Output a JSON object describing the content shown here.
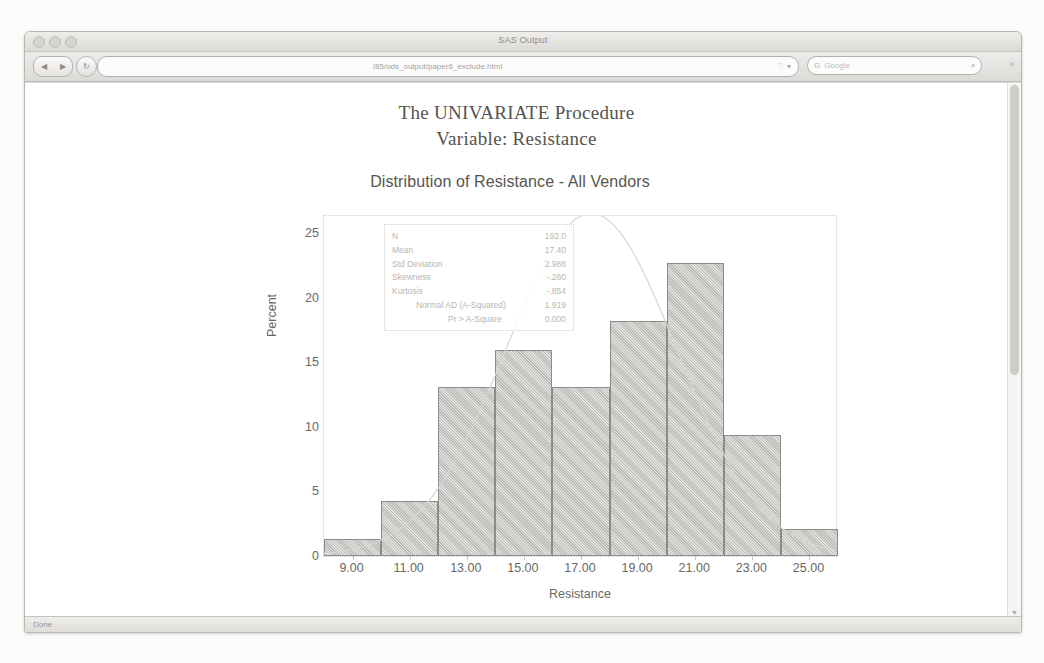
{
  "window": {
    "title": "SAS Output",
    "traffic_lights": [
      "close",
      "minimize",
      "zoom"
    ],
    "status_text": "Done"
  },
  "toolbar": {
    "back_label": "◀",
    "forward_label": "▶",
    "reload_label": "↻",
    "stop_label": "✕",
    "home_label": "⌂",
    "url": "/85/ods_output/paper6_exclude.html",
    "url_bookmark_icon": "♡",
    "url_dropdown_icon": "▾",
    "search_engine_icon": "G",
    "search_placeholder": "Google",
    "search_magnifier_icon": "⌕",
    "overflow_icon": "»"
  },
  "report": {
    "proc_title": "The UNIVARIATE Procedure",
    "proc_subtitle": "Variable: Resistance"
  },
  "chart_data": {
    "type": "bar",
    "title": "Distribution of Resistance - All Vendors",
    "xlabel": "Resistance",
    "ylabel": "Percent",
    "xlim": [
      8.0,
      26.0
    ],
    "ylim": [
      0,
      26.5
    ],
    "grid": false,
    "bin_width": 2.0,
    "bin_starts": [
      8.0,
      10.0,
      12.0,
      14.0,
      16.0,
      18.0,
      20.0,
      22.0,
      24.0
    ],
    "bin_centers": [
      9.0,
      11.0,
      13.0,
      15.0,
      17.0,
      19.0,
      21.0,
      23.0,
      25.0
    ],
    "values": [
      1.3,
      4.3,
      13.1,
      16.0,
      13.1,
      18.2,
      22.7,
      9.4,
      2.1
    ],
    "xticks": [
      "9.00",
      "11.00",
      "13.00",
      "15.00",
      "17.00",
      "19.00",
      "21.00",
      "23.00",
      "25.00"
    ],
    "yticks": [
      "0",
      "5",
      "10",
      "15",
      "20",
      "25"
    ],
    "ytick_values": [
      0,
      5,
      10,
      15,
      20,
      25
    ],
    "overlay": {
      "name": "Normal curve",
      "mean": 17.4,
      "std": 2.988
    },
    "legend_position": "none"
  },
  "stats_inset": [
    {
      "label": "N",
      "value": "192.0",
      "indent": 0
    },
    {
      "label": "Mean",
      "value": "17.40",
      "indent": 0
    },
    {
      "label": "Std Deviation",
      "value": "2.988",
      "indent": 0
    },
    {
      "label": "Skewness",
      "value": "-.260",
      "indent": 0
    },
    {
      "label": "Kurtosis",
      "value": "-.854",
      "indent": 0
    },
    {
      "label": "Normal AD (A-Squared)",
      "value": "1.919",
      "indent": 1
    },
    {
      "label": "Pr > A-Square",
      "value": "0.000",
      "indent": 2
    }
  ],
  "colors": {
    "bar_fill": "#bdbbb8",
    "bar_border": "#8d8b88",
    "axis_text": "#6a6864",
    "title_text": "#57554f",
    "inset_text": "#b8b6b2",
    "curve": "#d9d7d3"
  }
}
